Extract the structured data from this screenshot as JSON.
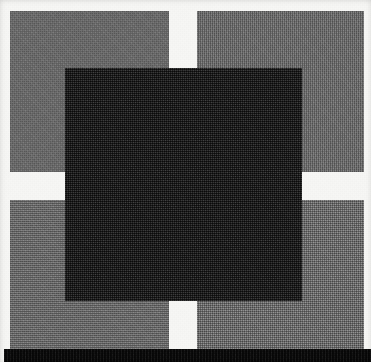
{
  "image": {
    "title": "Abstract geometric composition",
    "description": "Scanned halftone print: four gray rectangular blocks arranged in a 2x2 grid separated by a white cross, overlaid by a large centered near-black square, with a solid black horizontal band along the bottom edge.",
    "medium": "halftone-scan",
    "width_px": 371,
    "height_px": 362
  },
  "colors": {
    "paper": "#f6f6f4",
    "gray_block": "#717171",
    "dark_square": "#1d1d1d",
    "black_band": "#0b0b0b",
    "white_gap": "#f6f6f4"
  },
  "shapes": {
    "quadrants": [
      {
        "name": "top-left",
        "label": "Top left gray block",
        "x": 10,
        "y": 11,
        "w": 159,
        "h": 161,
        "fill": "#717171"
      },
      {
        "name": "top-right",
        "label": "Top right gray block",
        "x": 197,
        "y": 11,
        "w": 167,
        "h": 161,
        "fill": "#717171"
      },
      {
        "name": "bottom-left",
        "label": "Bottom left gray block",
        "x": 10,
        "y": 200,
        "w": 159,
        "h": 149,
        "fill": "#717171"
      },
      {
        "name": "bottom-right",
        "label": "Bottom right gray block",
        "x": 197,
        "y": 200,
        "w": 167,
        "h": 149,
        "fill": "#717171"
      }
    ],
    "center_square": {
      "name": "dark-square",
      "label": "Central dark square",
      "x": 65,
      "y": 68,
      "w": 237,
      "h": 233,
      "fill": "#1d1d1d"
    },
    "bottom_band": {
      "name": "bottom-band",
      "label": "Bottom black band",
      "x": 4,
      "y": 349,
      "w": 367,
      "h": 13,
      "fill": "#0b0b0b"
    },
    "gaps": {
      "vertical_gap": {
        "label": "Vertical white gap",
        "x": 169,
        "w": 28
      },
      "horizontal_gap": {
        "label": "Horizontal white gap",
        "y": 172,
        "h": 28
      }
    }
  }
}
